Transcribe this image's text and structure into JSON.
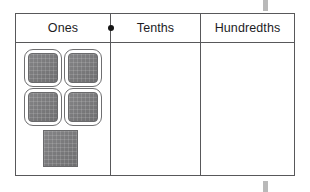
{
  "chart_data": {
    "type": "table",
    "columns": [
      "Ones",
      "Tenths",
      "Hundredths"
    ],
    "rows": [
      {
        "Ones": 5,
        "Tenths": 0,
        "Hundredths": 0
      }
    ],
    "annotations": [
      {
        "name": "decimal-point",
        "symbol": "•",
        "between": [
          "Ones",
          "Tenths"
        ]
      }
    ],
    "manipulatives": {
      "kind": "base-ten unit blocks",
      "column": "Ones",
      "count": 5,
      "arrangement": "2x2 grid of outlined units plus 1 plain unit below",
      "outlined_count": 4,
      "plain_count": 1
    }
  },
  "table": {
    "headers": [
      {
        "label": "Ones",
        "key": "ones"
      },
      {
        "label": "Tenths",
        "key": "tenths"
      },
      {
        "label": "Hundredths",
        "key": "hundredths"
      }
    ],
    "decimal_point": "•",
    "cells": {
      "ones_blocks": 5,
      "tenths_blocks": 0,
      "hundredths_blocks": 0
    }
  },
  "colors": {
    "block_fill": "#7b7b7d",
    "block_outline": "#6f6f71",
    "table_border": "#58585a",
    "decimal_point": "#151515",
    "scan_mark": "#b9b9b9",
    "page_background": "#ffffff"
  }
}
